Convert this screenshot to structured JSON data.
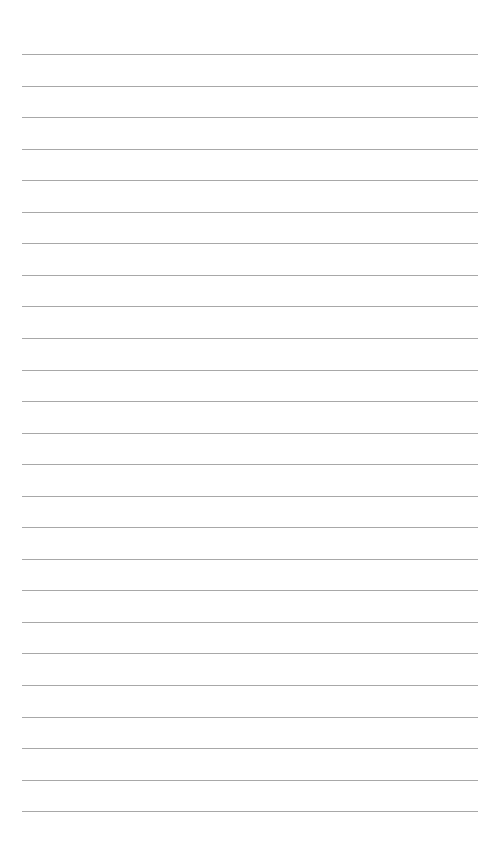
{
  "page": {
    "type": "lined-paper",
    "background_color": "#ffffff",
    "line_color": "#a8a8a8",
    "line_count": 25,
    "first_line_y": 54,
    "line_spacing": 31.55,
    "line_left": 22,
    "line_width": 456
  }
}
